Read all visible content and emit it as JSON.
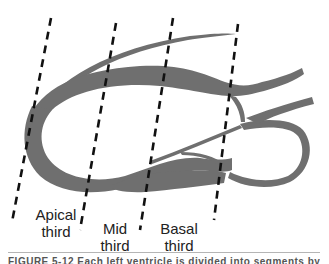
{
  "figure": {
    "type": "heart-diagram",
    "colors": {
      "myocardium": "#6f6f6f",
      "dashed_line": "#111111",
      "label_text": "#222222",
      "background": "#ffffff"
    },
    "regions": [
      {
        "id": "apical",
        "label_line1": "Apical",
        "label_line2": "third"
      },
      {
        "id": "mid",
        "label_line1": "Mid",
        "label_line2": "third"
      },
      {
        "id": "basal",
        "label_line1": "Basal",
        "label_line2": "third"
      }
    ],
    "divider_count": 4
  },
  "caption": {
    "text": "FIGURE 5-12  Each left ventricle is divided into segments by"
  }
}
